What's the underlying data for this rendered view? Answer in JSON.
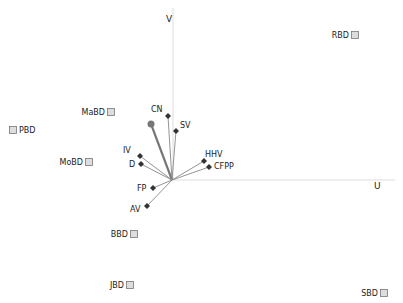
{
  "chart_data": {
    "type": "scatter",
    "subtype": "biplot",
    "title": "",
    "xlabel": "U",
    "ylabel": "V",
    "origin_px": [
      172,
      180
    ],
    "axes": {
      "u_axis": {
        "x1": 172,
        "y1": 180,
        "x2": 395,
        "y2": 180,
        "label": "U",
        "label_pos": [
          374,
          189
        ]
      },
      "v_axis": {
        "x1": 173,
        "y1": 8,
        "x2": 173,
        "y2": 180,
        "label": "V",
        "label_pos": [
          166,
          22
        ]
      }
    },
    "samples": [
      {
        "name": "RBD",
        "x": 355,
        "y": 35,
        "label_side": "left"
      },
      {
        "name": "MaBD",
        "x": 111,
        "y": 112,
        "label_side": "left"
      },
      {
        "name": "PBD",
        "x": 13,
        "y": 130,
        "label_side": "right"
      },
      {
        "name": "MoBD",
        "x": 89,
        "y": 162,
        "label_side": "left"
      },
      {
        "name": "BBD",
        "x": 134,
        "y": 234,
        "label_side": "left"
      },
      {
        "name": "JBD",
        "x": 130,
        "y": 285,
        "label_side": "left"
      },
      {
        "name": "SBD",
        "x": 384,
        "y": 293,
        "label_side": "left"
      }
    ],
    "variables": [
      {
        "name": "CN",
        "x": 168,
        "y": 116,
        "label_dx": -17,
        "label_dy": -4
      },
      {
        "name": "SV",
        "x": 176,
        "y": 131,
        "label_dx": 4,
        "label_dy": -3
      },
      {
        "name": "IV",
        "x": 140,
        "y": 156,
        "label_dx": -17,
        "label_dy": -3
      },
      {
        "name": "D",
        "x": 141,
        "y": 164,
        "label_dx": -12,
        "label_dy": 3
      },
      {
        "name": "HHV",
        "x": 204,
        "y": 161,
        "label_dx": 1,
        "label_dy": -4
      },
      {
        "name": "CFPP",
        "x": 209,
        "y": 167,
        "label_dx": 5,
        "label_dy": 2
      },
      {
        "name": "FP",
        "x": 153,
        "y": 188,
        "label_dx": -16,
        "label_dy": 3
      },
      {
        "name": "AV",
        "x": 147,
        "y": 206,
        "label_dx": -17,
        "label_dy": 6
      }
    ],
    "highlight_vector": {
      "name": "",
      "x": 151,
      "y": 124
    },
    "colors": {
      "axis": "#dddddd",
      "vector": "#888888",
      "highlight_vector": "#777777",
      "variable_marker": "#333333",
      "sample_marker_fill": "#dddddd",
      "sample_marker_stroke": "#777777",
      "text": "#222222"
    }
  }
}
